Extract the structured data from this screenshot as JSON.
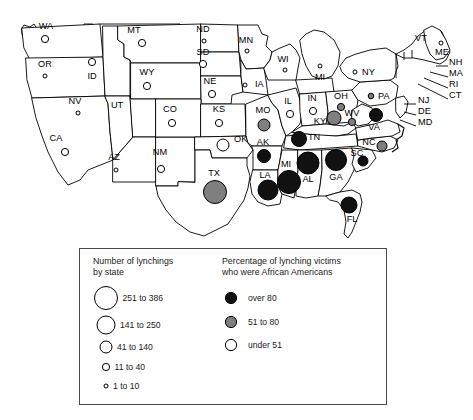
{
  "figure": {
    "kind": "choropleth-proportional-symbol-map",
    "region": "contiguous-united-states"
  },
  "chart_data": {
    "type": "scatter",
    "title": "",
    "subtitle": "",
    "xlabel": "",
    "ylabel": "",
    "grid": false,
    "legend_position": "bottom",
    "symbol_encoding": {
      "size": "Number of lynchings by state",
      "fill": "Percentage of lynching victims who were African Americans"
    },
    "size_classes": [
      {
        "label": "251 to 386",
        "radius_px": 11.5,
        "min": 251,
        "max": 386
      },
      {
        "label": "141 to 250",
        "radius_px": 9.0,
        "min": 141,
        "max": 250
      },
      {
        "label": "41 to 140",
        "radius_px": 6.0,
        "min": 41,
        "max": 140
      },
      {
        "label": "11 to 40",
        "radius_px": 3.6,
        "min": 11,
        "max": 40
      },
      {
        "label": "1 to 10",
        "radius_px": 2.0,
        "min": 1,
        "max": 10
      }
    ],
    "fill_classes": [
      {
        "label": "over 80",
        "color": "#111111"
      },
      {
        "label": "51 to 80",
        "color": "#7f7f7f"
      },
      {
        "label": "under 51",
        "color": "#ffffff"
      }
    ],
    "points": [
      {
        "state": "WA",
        "x": 45,
        "y": 39,
        "r": 3.6,
        "fill": "under51",
        "size_class": "11 to 40",
        "pct_class": "under 51",
        "label_x": 46,
        "label_y": 29,
        "label_anchor": "middle"
      },
      {
        "state": "OR",
        "x": 45,
        "y": 76,
        "r": 2.0,
        "fill": "under51",
        "size_class": "1 to 10",
        "pct_class": "under 51",
        "label_x": 45,
        "label_y": 67,
        "label_anchor": "middle"
      },
      {
        "state": "ID",
        "x": 92,
        "y": 62,
        "r": 3.6,
        "fill": "under51",
        "size_class": "11 to 40",
        "pct_class": "under 51",
        "label_x": 92,
        "label_y": 79,
        "label_anchor": "middle"
      },
      {
        "state": "MT",
        "x": 142,
        "y": 43,
        "r": 3.6,
        "fill": "under51",
        "size_class": "11 to 40",
        "pct_class": "under 51",
        "label_x": 134,
        "label_y": 33,
        "label_anchor": "middle"
      },
      {
        "state": "WY",
        "x": 147,
        "y": 86,
        "r": 3.6,
        "fill": "under51",
        "size_class": "11 to 40",
        "pct_class": "under 51",
        "label_x": 147,
        "label_y": 75,
        "label_anchor": "middle"
      },
      {
        "state": "NV",
        "x": 78,
        "y": 113,
        "r": 2.0,
        "fill": "under51",
        "size_class": "1 to 10",
        "pct_class": "under 51",
        "label_x": 75,
        "label_y": 104,
        "label_anchor": "middle"
      },
      {
        "state": "UT",
        "x": 117,
        "y": 120,
        "r": 0,
        "fill": "none",
        "size_class": "",
        "pct_class": "",
        "label_x": 117,
        "label_y": 108,
        "label_anchor": "middle"
      },
      {
        "state": "CA",
        "x": 65,
        "y": 152,
        "r": 3.6,
        "fill": "under51",
        "size_class": "11 to 40",
        "pct_class": "under 51",
        "label_x": 56,
        "label_y": 141,
        "label_anchor": "middle"
      },
      {
        "state": "AZ",
        "x": 116,
        "y": 170,
        "r": 2.0,
        "fill": "under51",
        "size_class": "1 to 10",
        "pct_class": "under 51",
        "label_x": 114,
        "label_y": 160,
        "label_anchor": "middle"
      },
      {
        "state": "NM",
        "x": 161,
        "y": 169,
        "r": 3.6,
        "fill": "under51",
        "size_class": "11 to 40",
        "pct_class": "under 51",
        "label_x": 160,
        "label_y": 155,
        "label_anchor": "middle"
      },
      {
        "state": "CO",
        "x": 172,
        "y": 123,
        "r": 3.6,
        "fill": "under51",
        "size_class": "11 to 40",
        "pct_class": "under 51",
        "label_x": 170,
        "label_y": 112,
        "label_anchor": "middle"
      },
      {
        "state": "ND",
        "x": 204,
        "y": 41,
        "r": 2.0,
        "fill": "under51",
        "size_class": "1 to 10",
        "pct_class": "under 51",
        "label_x": 203,
        "label_y": 32,
        "label_anchor": "middle"
      },
      {
        "state": "SD",
        "x": 203,
        "y": 64,
        "r": 3.6,
        "fill": "under51",
        "size_class": "11 to 40",
        "pct_class": "under 51",
        "label_x": 203,
        "label_y": 55,
        "label_anchor": "middle"
      },
      {
        "state": "NE",
        "x": 212,
        "y": 94,
        "r": 3.6,
        "fill": "under51",
        "size_class": "11 to 40",
        "pct_class": "under 51",
        "label_x": 210,
        "label_y": 84,
        "label_anchor": "middle"
      },
      {
        "state": "KS",
        "x": 219,
        "y": 123,
        "r": 3.6,
        "fill": "under51",
        "size_class": "11 to 40",
        "pct_class": "under 51",
        "label_x": 219,
        "label_y": 112,
        "label_anchor": "middle"
      },
      {
        "state": "OK",
        "x": 223,
        "y": 145,
        "r": 6.0,
        "fill": "under51",
        "size_class": "41 to 140",
        "pct_class": "under 51",
        "label_x": 234,
        "label_y": 142,
        "label_anchor": "start"
      },
      {
        "state": "TX",
        "x": 215,
        "y": 192,
        "r": 11.5,
        "fill": "51to80",
        "size_class": "251 to 386",
        "pct_class": "51 to 80",
        "label_x": 214,
        "label_y": 176,
        "label_anchor": "middle"
      },
      {
        "state": "MN",
        "x": 247,
        "y": 51,
        "r": 2.0,
        "fill": "under51",
        "size_class": "1 to 10",
        "pct_class": "under 51",
        "label_x": 246,
        "label_y": 43,
        "label_anchor": "middle"
      },
      {
        "state": "IA",
        "x": 245,
        "y": 85,
        "r": 2.0,
        "fill": "under51",
        "size_class": "1 to 10",
        "pct_class": "under 51",
        "label_x": 255,
        "label_y": 87,
        "label_anchor": "start"
      },
      {
        "state": "WI",
        "x": 285,
        "y": 70,
        "r": 2.0,
        "fill": "under51",
        "size_class": "1 to 10",
        "pct_class": "under 51",
        "label_x": 283,
        "label_y": 62,
        "label_anchor": "middle"
      },
      {
        "state": "MI",
        "x": 320,
        "y": 66,
        "r": 2.0,
        "fill": "under51",
        "size_class": "1 to 10",
        "pct_class": "under 51",
        "label_x": 320,
        "label_y": 80,
        "label_anchor": "middle"
      },
      {
        "state": "IL",
        "x": 290,
        "y": 114,
        "r": 3.6,
        "fill": "under51",
        "size_class": "11 to 40",
        "pct_class": "under 51",
        "label_x": 288,
        "label_y": 104,
        "label_anchor": "middle"
      },
      {
        "state": "IN",
        "x": 313,
        "y": 111,
        "r": 3.6,
        "fill": "under51",
        "size_class": "11 to 40",
        "pct_class": "under 51",
        "label_x": 312,
        "label_y": 101,
        "label_anchor": "middle"
      },
      {
        "state": "MO",
        "x": 264,
        "y": 125,
        "r": 6.0,
        "fill": "51to80",
        "size_class": "41 to 140",
        "pct_class": "51 to 80",
        "label_x": 263,
        "label_y": 113,
        "label_anchor": "middle"
      },
      {
        "state": "OH",
        "x": 341,
        "y": 107,
        "r": 3.6,
        "fill": "51to80",
        "size_class": "11 to 40",
        "pct_class": "51 to 80",
        "label_x": 341,
        "label_y": 99,
        "label_anchor": "middle"
      },
      {
        "state": "KY",
        "x": 334,
        "y": 118,
        "r": 7.0,
        "fill": "51to80",
        "size_class": "41 to 140",
        "pct_class": "51 to 80",
        "label_x": 320,
        "label_y": 124,
        "label_anchor": "middle"
      },
      {
        "state": "WV",
        "x": 352,
        "y": 122,
        "r": 3.6,
        "fill": "51to80",
        "size_class": "11 to 40",
        "pct_class": "51 to 80",
        "label_x": 352,
        "label_y": 116,
        "label_anchor": "middle"
      },
      {
        "state": "PA",
        "x": 371,
        "y": 96,
        "r": 2.8,
        "fill": "51to80",
        "size_class": "11 to 40",
        "pct_class": "51 to 80",
        "label_x": 378,
        "label_y": 99,
        "label_anchor": "start"
      },
      {
        "state": "VA",
        "x": 376,
        "y": 115,
        "r": 6.5,
        "fill": "over80",
        "size_class": "41 to 140",
        "pct_class": "over 80",
        "label_x": 374,
        "label_y": 130,
        "label_anchor": "middle"
      },
      {
        "state": "NY",
        "x": 355,
        "y": 72,
        "r": 2.0,
        "fill": "under51",
        "size_class": "1 to 10",
        "pct_class": "under 51",
        "label_x": 362,
        "label_y": 75,
        "label_anchor": "start"
      },
      {
        "state": "ME",
        "x": 441,
        "y": 43,
        "r": 2.0,
        "fill": "under51",
        "size_class": "1 to 10",
        "pct_class": "under 51",
        "label_x": 442,
        "label_y": 55,
        "label_anchor": "middle"
      },
      {
        "state": "AK",
        "x": 264,
        "y": 156,
        "r": 6.5,
        "fill": "over80",
        "size_class": "41 to 140",
        "pct_class": "over 80",
        "label_x": 263,
        "label_y": 145,
        "label_anchor": "middle"
      },
      {
        "state": "TN",
        "x": 299,
        "y": 139,
        "r": 7.5,
        "fill": "over80",
        "size_class": "141 to 250",
        "pct_class": "over 80",
        "label_x": 314,
        "label_y": 140,
        "label_anchor": "middle"
      },
      {
        "state": "NC",
        "x": 382,
        "y": 146,
        "r": 5.0,
        "fill": "51to80",
        "size_class": "41 to 140",
        "pct_class": "51 to 80",
        "label_x": 369,
        "label_y": 145,
        "label_anchor": "middle"
      },
      {
        "state": "SC",
        "x": 363,
        "y": 161,
        "r": 5.0,
        "fill": "over80",
        "size_class": "41 to 140",
        "pct_class": "over 80",
        "label_x": 357,
        "label_y": 156,
        "label_anchor": "middle"
      },
      {
        "state": "GA",
        "x": 336,
        "y": 160,
        "r": 10.5,
        "fill": "over80",
        "size_class": "251 to 386",
        "pct_class": "over 80",
        "label_x": 336,
        "label_y": 180,
        "label_anchor": "middle"
      },
      {
        "state": "AL",
        "x": 308,
        "y": 163,
        "r": 11.0,
        "fill": "over80",
        "size_class": "251 to 386",
        "pct_class": "over 80",
        "label_x": 308,
        "label_y": 182,
        "label_anchor": "middle"
      },
      {
        "state": "MI",
        "x": 289,
        "y": 182,
        "r": 11.5,
        "fill": "over80",
        "size_class": "251 to 386",
        "pct_class": "over 80",
        "label_x": 286,
        "label_y": 167,
        "label_anchor": "middle"
      },
      {
        "state": "LA",
        "x": 268,
        "y": 190,
        "r": 10.0,
        "fill": "over80",
        "size_class": "251 to 386",
        "pct_class": "over 80",
        "label_x": 265,
        "label_y": 178,
        "label_anchor": "middle"
      },
      {
        "state": "FL",
        "x": 349,
        "y": 205,
        "r": 8.0,
        "fill": "over80",
        "size_class": "141 to 250",
        "pct_class": "over 80",
        "label_x": 352,
        "label_y": 222,
        "label_anchor": "middle"
      }
    ],
    "leader_labels": [
      {
        "state": "VT",
        "label_x": 415,
        "label_y": 41
      },
      {
        "state": "NH",
        "label_x": 449,
        "label_y": 65
      },
      {
        "state": "MA",
        "label_x": 449,
        "label_y": 76
      },
      {
        "state": "RI",
        "label_x": 449,
        "label_y": 87
      },
      {
        "state": "CT",
        "label_x": 449,
        "label_y": 98
      },
      {
        "state": "NJ",
        "label_x": 418,
        "label_y": 103
      },
      {
        "state": "DE",
        "label_x": 418,
        "label_y": 114
      },
      {
        "state": "MD",
        "label_x": 418,
        "label_y": 125
      }
    ]
  },
  "legend": {
    "size_title_line1": "Number of lynchings",
    "size_title_line2": "by state",
    "pct_title_line1": "Percentage of lynching victims",
    "pct_title_line2": "who were African Americans",
    "size_entries": [
      {
        "label": "251 to 386"
      },
      {
        "label": "141 to 250"
      },
      {
        "label": "41 to 140"
      },
      {
        "label": "11 to 40"
      },
      {
        "label": "1 to 10"
      }
    ],
    "pct_entries": [
      {
        "label": "over 80"
      },
      {
        "label": "51 to 80"
      },
      {
        "label": "under 51"
      }
    ]
  },
  "colors": {
    "over80": "#111111",
    "mid": "#7f7f7f",
    "under51": "#ffffff",
    "stroke": "#000000",
    "legend_border": "#4a4a4a"
  }
}
